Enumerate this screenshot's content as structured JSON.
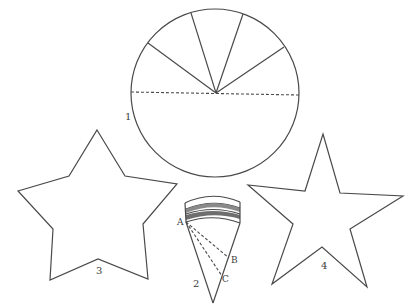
{
  "figure": {
    "ink_color": "#4a4a4a",
    "background": "#ffffff"
  },
  "labels": {
    "circle": "1",
    "cone": "2",
    "star_left": "3",
    "star_right": "4",
    "point_a": "A",
    "point_b": "B",
    "point_c": "C"
  },
  "circle": {
    "sector_lines_count": 4,
    "has_dashed_diameter": true
  },
  "cone": {
    "dashed_lines": [
      "A-B",
      "A-C"
    ],
    "banded_rim": true
  },
  "stars": [
    {
      "name": "star-3",
      "points": 5
    },
    {
      "name": "star-4",
      "points": 5
    }
  ]
}
